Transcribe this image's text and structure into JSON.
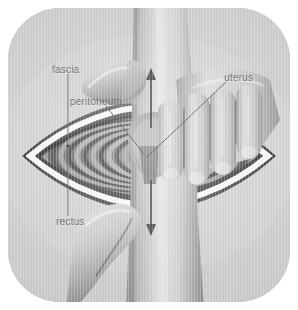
{
  "illustration": {
    "title": "Cesarean section - delivery of the uterus through the abdominal incision",
    "style": "greyscale medical illustration",
    "frame_shape": "rounded octagon panel",
    "background_color": "#c9c9c9",
    "label_color": "#6b6b6b",
    "leader_line_color": "#6f6f6f",
    "arrow_color": "#5a5a5a"
  },
  "labels": [
    {
      "id": "fascia",
      "text": "fascia",
      "position": "top-left",
      "leader": "vertical line down to the white fascia band of the incision"
    },
    {
      "id": "peritoneum",
      "text": "peritoneum",
      "position": "upper-left",
      "leader": "diagonal line down-right into the incision interior"
    },
    {
      "id": "rectus",
      "text": "rectus",
      "position": "lower-left",
      "leader": "vertical line up to the dark rectus muscle rim"
    },
    {
      "id": "uterus",
      "text": "uterus",
      "position": "upper-right",
      "leader": "diagonal line down-left to the uterine wall between the fingers"
    }
  ],
  "anatomy": [
    {
      "id": "incision",
      "name": "lens-shaped abdominal incision"
    },
    {
      "id": "rectus-muscle",
      "name": "rectus muscle (dark outer rim)"
    },
    {
      "id": "fascia-band",
      "name": "fascia (white band)"
    },
    {
      "id": "peritoneum-rings",
      "name": "peritoneum and uterine wall (concentric grey rings)"
    },
    {
      "id": "uterus-body",
      "name": "uterus emerging through incision"
    }
  ],
  "hands": [
    {
      "id": "upper-thumb",
      "name": "upper-left thumb pressing downward"
    },
    {
      "id": "lower-thumb",
      "name": "lower-left thumb pressing upward"
    },
    {
      "id": "fingers-right",
      "name": "four fingers of right hand pressing over incision"
    },
    {
      "id": "forearm",
      "name": "forearm crossing the field vertically"
    }
  ],
  "arrows": [
    {
      "id": "arrow-up",
      "direction": "up",
      "meaning": "upward traction above the incision"
    },
    {
      "id": "arrow-down",
      "direction": "down",
      "meaning": "downward traction below the incision"
    }
  ]
}
